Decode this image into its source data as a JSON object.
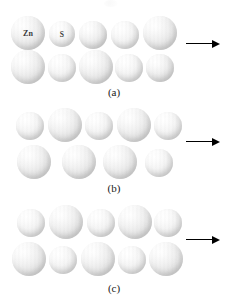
{
  "figure": {
    "background_color": "#ffffff",
    "width": 228,
    "height": 306
  },
  "atom_types": {
    "zn": {
      "label": "Zn",
      "radius": 17,
      "color": "#e2e2e2",
      "name": "zinc-atom"
    },
    "s": {
      "label": "S",
      "radius": 13,
      "color": "#ededed",
      "name": "sulfur-atom"
    }
  },
  "arrow": {
    "color": "#000000",
    "direction": "right",
    "meaning": "applied shear force"
  },
  "panels": [
    {
      "id": "a",
      "caption": "(a)",
      "caption_y": 86,
      "top": 8,
      "height": 96,
      "arrow": {
        "x": 186,
        "y": 44,
        "length": 34
      },
      "rows": [
        {
          "name": "upper-row",
          "atoms": [
            {
              "type": "zn",
              "cx": 28,
              "cy": 33,
              "r": 17,
              "label": "Zn"
            },
            {
              "type": "s",
              "cx": 62,
              "cy": 34,
              "r": 13,
              "label": "S"
            },
            {
              "type": "zn",
              "cx": 93,
              "cy": 35,
              "r": 14
            },
            {
              "type": "s",
              "cx": 125,
              "cy": 35,
              "r": 14
            },
            {
              "type": "zn",
              "cx": 160,
              "cy": 33,
              "r": 17
            }
          ]
        },
        {
          "name": "lower-row",
          "atoms": [
            {
              "type": "zn",
              "cx": 28,
              "cy": 67,
              "r": 17
            },
            {
              "type": "s",
              "cx": 62,
              "cy": 68,
              "r": 14
            },
            {
              "type": "zn",
              "cx": 96,
              "cy": 67,
              "r": 17
            },
            {
              "type": "s",
              "cx": 129,
              "cy": 68,
              "r": 14
            },
            {
              "type": "zn",
              "cx": 160,
              "cy": 68,
              "r": 14
            }
          ]
        }
      ]
    },
    {
      "id": "b",
      "caption": "(b)",
      "caption_y": 182,
      "top": 106,
      "height": 96,
      "arrow": {
        "x": 186,
        "y": 142,
        "length": 34
      },
      "rows": [
        {
          "name": "upper-row",
          "atoms": [
            {
              "type": "s",
              "cx": 30,
              "cy": 126,
              "r": 14
            },
            {
              "type": "zn",
              "cx": 65,
              "cy": 125,
              "r": 17
            },
            {
              "type": "s",
              "cx": 99,
              "cy": 126,
              "r": 14
            },
            {
              "type": "zn",
              "cx": 134,
              "cy": 125,
              "r": 17
            },
            {
              "type": "s",
              "cx": 168,
              "cy": 126,
              "r": 14
            }
          ]
        },
        {
          "name": "lower-row",
          "atoms": [
            {
              "type": "zn",
              "cx": 34,
              "cy": 162,
              "r": 17
            },
            {
              "type": "zn",
              "cx": 79,
              "cy": 162,
              "r": 17
            },
            {
              "type": "zn",
              "cx": 120,
              "cy": 162,
              "r": 17
            },
            {
              "type": "s",
              "cx": 159,
              "cy": 163,
              "r": 14
            }
          ]
        }
      ]
    },
    {
      "id": "c",
      "caption": "(c)",
      "caption_y": 282,
      "top": 204,
      "height": 96,
      "arrow": {
        "x": 186,
        "y": 240,
        "length": 34
      },
      "rows": [
        {
          "name": "upper-row",
          "atoms": [
            {
              "type": "s",
              "cx": 31,
              "cy": 223,
              "r": 14
            },
            {
              "type": "zn",
              "cx": 66,
              "cy": 222,
              "r": 17
            },
            {
              "type": "s",
              "cx": 101,
              "cy": 223,
              "r": 14
            },
            {
              "type": "zn",
              "cx": 135,
              "cy": 222,
              "r": 17
            },
            {
              "type": "s",
              "cx": 168,
              "cy": 223,
              "r": 14
            }
          ]
        },
        {
          "name": "lower-row",
          "atoms": [
            {
              "type": "zn",
              "cx": 29,
              "cy": 259,
              "r": 17
            },
            {
              "type": "s",
              "cx": 63,
              "cy": 260,
              "r": 14
            },
            {
              "type": "zn",
              "cx": 98,
              "cy": 259,
              "r": 17
            },
            {
              "type": "s",
              "cx": 132,
              "cy": 260,
              "r": 14
            },
            {
              "type": "zn",
              "cx": 166,
              "cy": 259,
              "r": 17
            }
          ]
        }
      ]
    }
  ]
}
